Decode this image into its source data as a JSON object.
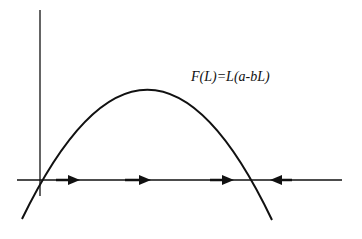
{
  "diagram": {
    "title": "",
    "function_label": "F(L)=L(a-bL)",
    "curve": {
      "type": "parabola",
      "shape": "downward",
      "roots": [
        "0",
        "a/b"
      ],
      "color": "#111111"
    },
    "axes": {
      "horizontal": "L",
      "vertical": "F(L)",
      "color": "#111111"
    },
    "flow_arrows": [
      {
        "position": "between 0 and a/b",
        "direction": "right"
      },
      {
        "position": "between 0 and a/b",
        "direction": "right"
      },
      {
        "position": "between 0 and a/b",
        "direction": "right"
      },
      {
        "position": "right of a/b",
        "direction": "left"
      }
    ]
  }
}
